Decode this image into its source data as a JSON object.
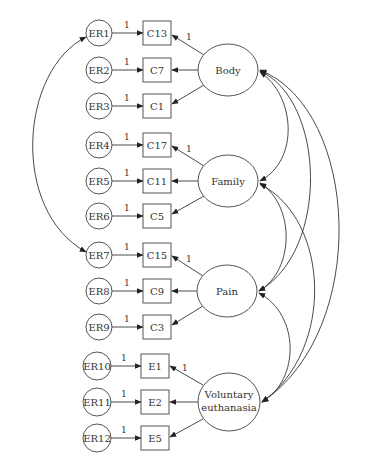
{
  "diagram": {
    "type": "structural-equation-model",
    "colors": {
      "line": "#4a4a4a",
      "shape_stroke": "#555555",
      "text": "#333333",
      "background": "#ffffff"
    },
    "factors": [
      {
        "id": "body",
        "label": "Body",
        "cx": 228,
        "cy": 70,
        "rx": 30,
        "ry": 26,
        "indicators": [
          {
            "label": "C13",
            "error": "ER1",
            "y": 33,
            "loading": "1",
            "error_weight": "1"
          },
          {
            "label": "C7",
            "error": "ER2",
            "y": 70,
            "loading": "",
            "error_weight": "1"
          },
          {
            "label": "C1",
            "error": "ER3",
            "y": 106,
            "loading": "",
            "error_weight": "1"
          }
        ]
      },
      {
        "id": "family",
        "label": "Family",
        "cx": 228,
        "cy": 181,
        "rx": 30,
        "ry": 26,
        "indicators": [
          {
            "label": "C17",
            "error": "ER4",
            "y": 145,
            "loading": "1",
            "error_weight": "1"
          },
          {
            "label": "C11",
            "error": "ER5",
            "y": 181,
            "loading": "",
            "error_weight": "1"
          },
          {
            "label": "C5",
            "error": "ER6",
            "y": 216,
            "loading": "",
            "error_weight": "1"
          }
        ]
      },
      {
        "id": "pain",
        "label": "Pain",
        "cx": 227,
        "cy": 291,
        "rx": 30,
        "ry": 26,
        "indicators": [
          {
            "label": "C15",
            "error": "ER7",
            "y": 255,
            "loading": "1",
            "error_weight": "1"
          },
          {
            "label": "C9",
            "error": "ER8",
            "y": 291,
            "loading": "",
            "error_weight": "1"
          },
          {
            "label": "C3",
            "error": "ER9",
            "y": 327,
            "loading": "",
            "error_weight": "1"
          }
        ]
      },
      {
        "id": "voluntary-euthanasia",
        "label_line1": "Voluntary",
        "label_line2": "euthanasia",
        "cx": 229,
        "cy": 402,
        "rx": 31,
        "ry": 29,
        "indicators": [
          {
            "label": "E1",
            "error": "ER10",
            "y": 366,
            "loading": "1",
            "error_weight": "1"
          },
          {
            "label": "E2",
            "error": "ER11",
            "y": 402,
            "loading": "",
            "error_weight": "1"
          },
          {
            "label": "E5",
            "error": "ER12",
            "y": 438,
            "loading": "",
            "error_weight": "1"
          }
        ]
      }
    ],
    "error_covariances": [
      {
        "from": "ER1",
        "to": "ER7"
      }
    ],
    "factor_covariances": [
      {
        "from": "Body",
        "to": "Family"
      },
      {
        "from": "Body",
        "to": "Pain"
      },
      {
        "from": "Body",
        "to": "Voluntary euthanasia"
      },
      {
        "from": "Family",
        "to": "Pain"
      },
      {
        "from": "Family",
        "to": "Voluntary euthanasia"
      },
      {
        "from": "Pain",
        "to": "Voluntary euthanasia"
      }
    ]
  }
}
